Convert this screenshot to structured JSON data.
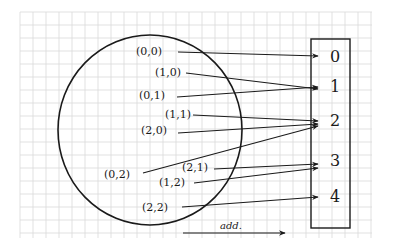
{
  "diagram": {
    "type": "mapping",
    "colors": {
      "ink": "#1a1a1a",
      "grid": "#d9d9d9",
      "background": "#ffffff"
    },
    "grid": {
      "x0": 20,
      "y0": 12,
      "x1": 372,
      "y1": 238,
      "step": 13
    },
    "domain_set": {
      "shape": "circle",
      "cx": 150,
      "cy": 130,
      "rx": 92,
      "ry": 95
    },
    "codomain": {
      "shape": "column-box",
      "x": 311,
      "y": 39,
      "width": 39,
      "height": 189,
      "slots": [
        {
          "label": "0",
          "x": 330,
          "y": 62
        },
        {
          "label": "1",
          "x": 330,
          "y": 92
        },
        {
          "label": "2",
          "x": 330,
          "y": 126
        },
        {
          "label": "3",
          "x": 330,
          "y": 166
        },
        {
          "label": "4",
          "x": 330,
          "y": 202
        }
      ]
    },
    "pairs": [
      {
        "label": "(0,0)",
        "lx": 136,
        "ly": 55,
        "from": [
          178,
          52
        ],
        "to": [
          318,
          56
        ],
        "slot": "0"
      },
      {
        "label": "(1,0)",
        "lx": 155,
        "ly": 76,
        "from": [
          186,
          73
        ],
        "to": [
          318,
          89
        ],
        "slot": "1"
      },
      {
        "label": "(0,1)",
        "lx": 139,
        "ly": 99,
        "from": [
          177,
          97
        ],
        "to": [
          318,
          87
        ],
        "slot": "1"
      },
      {
        "label": "(1,1)",
        "lx": 165,
        "ly": 118,
        "from": [
          193,
          115
        ],
        "to": [
          318,
          121
        ],
        "slot": "2"
      },
      {
        "label": "(2,0)",
        "lx": 141,
        "ly": 134,
        "from": [
          178,
          133
        ],
        "to": [
          318,
          124
        ],
        "slot": "2"
      },
      {
        "label": "(0,2)",
        "lx": 104,
        "ly": 178,
        "from": [
          143,
          173
        ],
        "to": [
          318,
          126
        ],
        "slot": "2"
      },
      {
        "label": "(2,1)",
        "lx": 182,
        "ly": 171,
        "from": [
          214,
          169
        ],
        "to": [
          318,
          164
        ],
        "slot": "3"
      },
      {
        "label": "(1,2)",
        "lx": 159,
        "ly": 186,
        "from": [
          194,
          183
        ],
        "to": [
          318,
          168
        ],
        "slot": "3"
      },
      {
        "label": "(2,2)",
        "lx": 142,
        "ly": 211,
        "from": [
          182,
          207
        ],
        "to": [
          318,
          197
        ],
        "slot": "4"
      }
    ],
    "annotation": {
      "text": "add.",
      "tx": 220,
      "ty": 229,
      "arrow_from": [
        183,
        233
      ],
      "arrow_to": [
        285,
        233
      ]
    }
  }
}
